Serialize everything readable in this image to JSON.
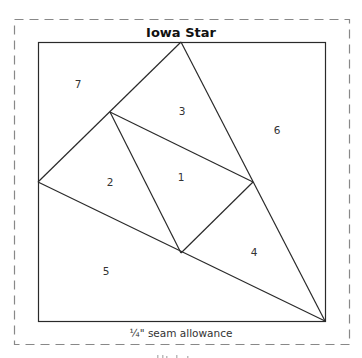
{
  "title": "Iowa Star",
  "seam_allowance_label": "¼\" seam allowance",
  "colors": {
    "line": "#2a2a2a",
    "dashed_border": "#888888",
    "text": "#333333"
  },
  "pieces": [
    {
      "number": "1"
    },
    {
      "number": "2"
    },
    {
      "number": "3"
    },
    {
      "number": "4"
    },
    {
      "number": "5"
    },
    {
      "number": "6"
    },
    {
      "number": "7"
    }
  ]
}
